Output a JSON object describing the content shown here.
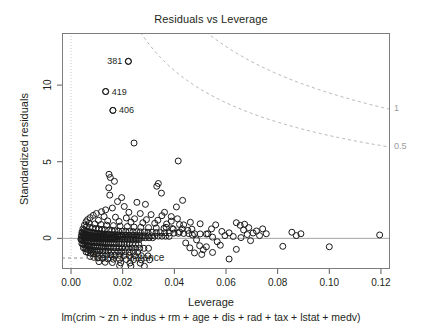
{
  "chart_data": {
    "type": "scatter",
    "title": "Residuals vs Leverage",
    "xlabel": "Leverage",
    "ylabel": "Standardized residuals",
    "caption": "lm(crim ~ zn + indus + rm + age + dis + rad + tax + lstat + medv)",
    "xlim": [
      -0.0035,
      0.1235
    ],
    "ylim": [
      -2.0,
      13.4
    ],
    "xticks": [
      0.0,
      0.02,
      0.04,
      0.06,
      0.08,
      0.1,
      0.12
    ],
    "xtick_labels": [
      "0.00",
      "0.02",
      "0.04",
      "0.06",
      "0.08",
      "0.10",
      "0.12"
    ],
    "yticks": [
      0,
      5,
      10
    ],
    "ytick_labels": [
      "0",
      "5",
      "10"
    ],
    "grid": false,
    "legend": {
      "position": "bottom-left",
      "label": "Cook's distance",
      "style": "dashed"
    },
    "reference_lines": {
      "horizontal_y": 0,
      "vertical_x": 0,
      "color": "#8c8c8c"
    },
    "cooks_contours": {
      "levels": [
        0.5,
        1
      ],
      "labels": [
        "0.5",
        "1"
      ],
      "p": 10,
      "color": "#b0b0b0",
      "style": "dashed"
    },
    "labeled_points": [
      {
        "label": "381",
        "x": 0.0222,
        "y": 11.55,
        "label_side": "left"
      },
      {
        "label": "419",
        "x": 0.0134,
        "y": 9.58,
        "label_side": "right"
      },
      {
        "label": "406",
        "x": 0.0162,
        "y": 8.35,
        "label_side": "right"
      }
    ],
    "point_style": {
      "marker": "open-circle",
      "radius": 3.0,
      "color": "#1a1a1a"
    },
    "points": [
      [
        0.0222,
        11.55
      ],
      [
        0.0134,
        9.58
      ],
      [
        0.0162,
        8.35
      ],
      [
        0.0244,
        6.22
      ],
      [
        0.0415,
        5.05
      ],
      [
        0.0147,
        4.18
      ],
      [
        0.0152,
        3.97
      ],
      [
        0.0168,
        3.72
      ],
      [
        0.0146,
        3.3
      ],
      [
        0.0338,
        3.58
      ],
      [
        0.0332,
        3.4
      ],
      [
        0.015,
        2.82
      ],
      [
        0.0196,
        2.66
      ],
      [
        0.018,
        2.4
      ],
      [
        0.0255,
        2.35
      ],
      [
        0.0288,
        2.22
      ],
      [
        0.0206,
        2.08
      ],
      [
        0.016,
        1.98
      ],
      [
        0.0134,
        1.86
      ],
      [
        0.0118,
        1.74
      ],
      [
        0.0224,
        1.7
      ],
      [
        0.0268,
        1.62
      ],
      [
        0.031,
        1.55
      ],
      [
        0.0352,
        1.48
      ],
      [
        0.0098,
        1.62
      ],
      [
        0.0086,
        1.5
      ],
      [
        0.0128,
        1.42
      ],
      [
        0.0172,
        1.38
      ],
      [
        0.0214,
        1.33
      ],
      [
        0.0246,
        1.28
      ],
      [
        0.0292,
        1.22
      ],
      [
        0.0336,
        1.18
      ],
      [
        0.0388,
        1.12
      ],
      [
        0.0074,
        1.35
      ],
      [
        0.0064,
        1.22
      ],
      [
        0.0106,
        1.18
      ],
      [
        0.0142,
        1.14
      ],
      [
        0.0186,
        1.1
      ],
      [
        0.0232,
        1.06
      ],
      [
        0.0278,
        1.02
      ],
      [
        0.0324,
        0.98
      ],
      [
        0.037,
        0.94
      ],
      [
        0.042,
        0.9
      ],
      [
        0.0058,
        1.08
      ],
      [
        0.007,
        0.98
      ],
      [
        0.0092,
        0.94
      ],
      [
        0.0116,
        0.9
      ],
      [
        0.0138,
        0.86
      ],
      [
        0.0164,
        0.83
      ],
      [
        0.019,
        0.8
      ],
      [
        0.0218,
        0.77
      ],
      [
        0.0244,
        0.74
      ],
      [
        0.027,
        0.72
      ],
      [
        0.03,
        0.7
      ],
      [
        0.033,
        0.68
      ],
      [
        0.036,
        0.66
      ],
      [
        0.0392,
        0.64
      ],
      [
        0.043,
        0.62
      ],
      [
        0.0468,
        0.6
      ],
      [
        0.0052,
        0.86
      ],
      [
        0.006,
        0.78
      ],
      [
        0.0072,
        0.72
      ],
      [
        0.0084,
        0.68
      ],
      [
        0.0096,
        0.64
      ],
      [
        0.0108,
        0.61
      ],
      [
        0.012,
        0.58
      ],
      [
        0.0132,
        0.56
      ],
      [
        0.0146,
        0.54
      ],
      [
        0.0158,
        0.52
      ],
      [
        0.017,
        0.5
      ],
      [
        0.0184,
        0.48
      ],
      [
        0.0198,
        0.47
      ],
      [
        0.0212,
        0.46
      ],
      [
        0.0226,
        0.45
      ],
      [
        0.024,
        0.44
      ],
      [
        0.0254,
        0.43
      ],
      [
        0.0268,
        0.42
      ],
      [
        0.0284,
        0.41
      ],
      [
        0.0298,
        0.4
      ],
      [
        0.0314,
        0.39
      ],
      [
        0.033,
        0.38
      ],
      [
        0.0346,
        0.37
      ],
      [
        0.0362,
        0.36
      ],
      [
        0.038,
        0.35
      ],
      [
        0.0398,
        0.34
      ],
      [
        0.0416,
        0.33
      ],
      [
        0.0436,
        0.32
      ],
      [
        0.0456,
        0.31
      ],
      [
        0.0478,
        0.3
      ],
      [
        0.05,
        0.29
      ],
      [
        0.0524,
        0.28
      ],
      [
        0.0046,
        0.62
      ],
      [
        0.005,
        0.55
      ],
      [
        0.0056,
        0.5
      ],
      [
        0.0062,
        0.46
      ],
      [
        0.0068,
        0.43
      ],
      [
        0.0074,
        0.4
      ],
      [
        0.008,
        0.38
      ],
      [
        0.0086,
        0.36
      ],
      [
        0.0092,
        0.34
      ],
      [
        0.0098,
        0.32
      ],
      [
        0.0104,
        0.31
      ],
      [
        0.011,
        0.3
      ],
      [
        0.0116,
        0.29
      ],
      [
        0.0122,
        0.28
      ],
      [
        0.0128,
        0.27
      ],
      [
        0.0134,
        0.26
      ],
      [
        0.014,
        0.25
      ],
      [
        0.0148,
        0.25
      ],
      [
        0.0156,
        0.24
      ],
      [
        0.0164,
        0.23
      ],
      [
        0.0172,
        0.23
      ],
      [
        0.018,
        0.22
      ],
      [
        0.0188,
        0.22
      ],
      [
        0.0196,
        0.21
      ],
      [
        0.0204,
        0.21
      ],
      [
        0.0214,
        0.2
      ],
      [
        0.0224,
        0.2
      ],
      [
        0.0234,
        0.19
      ],
      [
        0.0244,
        0.19
      ],
      [
        0.0254,
        0.18
      ],
      [
        0.0264,
        0.18
      ],
      [
        0.0276,
        0.17
      ],
      [
        0.0288,
        0.17
      ],
      [
        0.03,
        0.16
      ],
      [
        0.0312,
        0.16
      ],
      [
        0.0324,
        0.15
      ],
      [
        0.0338,
        0.15
      ],
      [
        0.0352,
        0.14
      ],
      [
        0.0366,
        0.14
      ],
      [
        0.038,
        0.13
      ],
      [
        0.0042,
        0.4
      ],
      [
        0.0044,
        0.34
      ],
      [
        0.0048,
        0.3
      ],
      [
        0.0052,
        0.27
      ],
      [
        0.0058,
        0.24
      ],
      [
        0.0064,
        0.22
      ],
      [
        0.007,
        0.2
      ],
      [
        0.0076,
        0.18
      ],
      [
        0.0082,
        0.17
      ],
      [
        0.0088,
        0.16
      ],
      [
        0.0094,
        0.15
      ],
      [
        0.01,
        0.14
      ],
      [
        0.0106,
        0.13
      ],
      [
        0.0112,
        0.12
      ],
      [
        0.0118,
        0.12
      ],
      [
        0.0124,
        0.11
      ],
      [
        0.013,
        0.11
      ],
      [
        0.0136,
        0.1
      ],
      [
        0.0142,
        0.1
      ],
      [
        0.015,
        0.09
      ],
      [
        0.0158,
        0.09
      ],
      [
        0.0166,
        0.08
      ],
      [
        0.0174,
        0.08
      ],
      [
        0.0182,
        0.08
      ],
      [
        0.019,
        0.07
      ],
      [
        0.02,
        0.07
      ],
      [
        0.021,
        0.07
      ],
      [
        0.022,
        0.06
      ],
      [
        0.023,
        0.06
      ],
      [
        0.024,
        0.06
      ],
      [
        0.0252,
        0.05
      ],
      [
        0.0264,
        0.05
      ],
      [
        0.0276,
        0.05
      ],
      [
        0.0288,
        0.04
      ],
      [
        0.0302,
        0.04
      ],
      [
        0.0316,
        0.04
      ],
      [
        0.004,
        0.18
      ],
      [
        0.0042,
        0.14
      ],
      [
        0.0046,
        0.11
      ],
      [
        0.005,
        0.09
      ],
      [
        0.0054,
        0.07
      ],
      [
        0.0058,
        0.05
      ],
      [
        0.0064,
        0.04
      ],
      [
        0.007,
        0.03
      ],
      [
        0.0076,
        0.02
      ],
      [
        0.0082,
        0.01
      ],
      [
        0.0088,
        0.0
      ],
      [
        0.0094,
        0.0
      ],
      [
        0.01,
        -0.01
      ],
      [
        0.0106,
        -0.01
      ],
      [
        0.0112,
        -0.02
      ],
      [
        0.0118,
        -0.02
      ],
      [
        0.0124,
        -0.03
      ],
      [
        0.013,
        -0.03
      ],
      [
        0.0138,
        -0.03
      ],
      [
        0.0146,
        -0.04
      ],
      [
        0.0154,
        -0.04
      ],
      [
        0.0162,
        -0.04
      ],
      [
        0.017,
        -0.05
      ],
      [
        0.0178,
        -0.05
      ],
      [
        0.0188,
        -0.05
      ],
      [
        0.0198,
        -0.06
      ],
      [
        0.0208,
        -0.06
      ],
      [
        0.0218,
        -0.06
      ],
      [
        0.0228,
        -0.07
      ],
      [
        0.024,
        -0.07
      ],
      [
        0.0252,
        -0.07
      ],
      [
        0.0264,
        -0.08
      ],
      [
        0.0038,
        -0.05
      ],
      [
        0.004,
        -0.09
      ],
      [
        0.0044,
        -0.12
      ],
      [
        0.0048,
        -0.15
      ],
      [
        0.0052,
        -0.17
      ],
      [
        0.0056,
        -0.19
      ],
      [
        0.0062,
        -0.21
      ],
      [
        0.0068,
        -0.23
      ],
      [
        0.0074,
        -0.24
      ],
      [
        0.008,
        -0.25
      ],
      [
        0.0086,
        -0.26
      ],
      [
        0.0092,
        -0.27
      ],
      [
        0.0098,
        -0.28
      ],
      [
        0.0104,
        -0.29
      ],
      [
        0.011,
        -0.3
      ],
      [
        0.0116,
        -0.3
      ],
      [
        0.0122,
        -0.31
      ],
      [
        0.0128,
        -0.32
      ],
      [
        0.0136,
        -0.32
      ],
      [
        0.0144,
        -0.33
      ],
      [
        0.0152,
        -0.33
      ],
      [
        0.016,
        -0.34
      ],
      [
        0.0168,
        -0.34
      ],
      [
        0.0176,
        -0.35
      ],
      [
        0.0186,
        -0.35
      ],
      [
        0.0196,
        -0.36
      ],
      [
        0.0206,
        -0.36
      ],
      [
        0.0216,
        -0.37
      ],
      [
        0.0226,
        -0.37
      ],
      [
        0.0238,
        -0.38
      ],
      [
        0.025,
        -0.38
      ],
      [
        0.0262,
        -0.39
      ],
      [
        0.0042,
        -0.34
      ],
      [
        0.0046,
        -0.38
      ],
      [
        0.005,
        -0.42
      ],
      [
        0.0056,
        -0.45
      ],
      [
        0.0062,
        -0.47
      ],
      [
        0.0068,
        -0.49
      ],
      [
        0.0074,
        -0.51
      ],
      [
        0.008,
        -0.52
      ],
      [
        0.0086,
        -0.53
      ],
      [
        0.0094,
        -0.54
      ],
      [
        0.0102,
        -0.55
      ],
      [
        0.011,
        -0.56
      ],
      [
        0.0118,
        -0.57
      ],
      [
        0.0126,
        -0.58
      ],
      [
        0.0134,
        -0.58
      ],
      [
        0.0144,
        -0.59
      ],
      [
        0.0154,
        -0.6
      ],
      [
        0.0164,
        -0.6
      ],
      [
        0.0174,
        -0.61
      ],
      [
        0.0186,
        -0.61
      ],
      [
        0.0198,
        -0.62
      ],
      [
        0.021,
        -0.62
      ],
      [
        0.0222,
        -0.63
      ],
      [
        0.0236,
        -0.63
      ],
      [
        0.025,
        -0.64
      ],
      [
        0.0266,
        -0.64
      ],
      [
        0.0282,
        -0.65
      ],
      [
        0.03,
        -0.65
      ],
      [
        0.0048,
        -0.62
      ],
      [
        0.0054,
        -0.66
      ],
      [
        0.006,
        -0.7
      ],
      [
        0.0068,
        -0.73
      ],
      [
        0.0076,
        -0.75
      ],
      [
        0.0084,
        -0.77
      ],
      [
        0.0092,
        -0.79
      ],
      [
        0.0102,
        -0.8
      ],
      [
        0.0112,
        -0.81
      ],
      [
        0.0122,
        -0.82
      ],
      [
        0.0132,
        -0.83
      ],
      [
        0.0144,
        -0.84
      ],
      [
        0.0156,
        -0.85
      ],
      [
        0.0168,
        -0.85
      ],
      [
        0.0182,
        -0.86
      ],
      [
        0.0196,
        -0.87
      ],
      [
        0.021,
        -0.87
      ],
      [
        0.0226,
        -0.88
      ],
      [
        0.0242,
        -0.88
      ],
      [
        0.0258,
        -0.89
      ],
      [
        0.0058,
        -0.88
      ],
      [
        0.0066,
        -0.93
      ],
      [
        0.0076,
        -0.97
      ],
      [
        0.0086,
        -1.0
      ],
      [
        0.0098,
        -1.03
      ],
      [
        0.011,
        -1.05
      ],
      [
        0.0124,
        -1.07
      ],
      [
        0.0138,
        -1.08
      ],
      [
        0.0154,
        -1.09
      ],
      [
        0.017,
        -1.1
      ],
      [
        0.0188,
        -1.11
      ],
      [
        0.0206,
        -1.12
      ],
      [
        0.0226,
        -1.12
      ],
      [
        0.0248,
        -1.13
      ],
      [
        0.0272,
        -1.13
      ],
      [
        0.0298,
        -1.14
      ],
      [
        0.0074,
        -1.18
      ],
      [
        0.0088,
        -1.24
      ],
      [
        0.0104,
        -1.28
      ],
      [
        0.0122,
        -1.31
      ],
      [
        0.0142,
        -1.34
      ],
      [
        0.0164,
        -1.36
      ],
      [
        0.0188,
        -1.37
      ],
      [
        0.0214,
        -1.38
      ],
      [
        0.0242,
        -1.39
      ],
      [
        0.0272,
        -1.4
      ],
      [
        0.0304,
        -1.4
      ],
      [
        0.0108,
        -1.52
      ],
      [
        0.0132,
        -1.56
      ],
      [
        0.016,
        -1.58
      ],
      [
        0.0192,
        -1.6
      ],
      [
        0.0228,
        -1.61
      ],
      [
        0.0268,
        -1.62
      ],
      [
        0.0188,
        -1.78
      ],
      [
        0.0232,
        -1.8
      ],
      [
        0.0284,
        -1.82
      ],
      [
        0.0362,
        1.7
      ],
      [
        0.0388,
        1.42
      ],
      [
        0.0412,
        1.28
      ],
      [
        0.0436,
        0.88
      ],
      [
        0.0452,
        0.52
      ],
      [
        0.047,
        0.22
      ],
      [
        0.0486,
        -0.1
      ],
      [
        0.0498,
        -0.48
      ],
      [
        0.0512,
        -0.74
      ],
      [
        0.053,
        0.3
      ],
      [
        0.0548,
        0.08
      ],
      [
        0.0566,
        -0.22
      ],
      [
        0.0584,
        0.45
      ],
      [
        0.0408,
        2.05
      ],
      [
        0.0432,
        2.48
      ],
      [
        0.035,
        2.95
      ],
      [
        0.0368,
        0.72
      ],
      [
        0.0396,
        0.6
      ],
      [
        0.042,
        0.42
      ],
      [
        0.0444,
        -0.3
      ],
      [
        0.046,
        -0.62
      ],
      [
        0.0478,
        -0.95
      ],
      [
        0.0506,
        -1.05
      ],
      [
        0.0524,
        -0.55
      ],
      [
        0.0544,
        0.62
      ],
      [
        0.056,
        0.88
      ],
      [
        0.0578,
        -0.45
      ],
      [
        0.0596,
        0.18
      ],
      [
        0.0612,
        0.36
      ],
      [
        0.0628,
        0.12
      ],
      [
        0.064,
        -0.72
      ],
      [
        0.0658,
        0.05
      ],
      [
        0.0668,
        0.55
      ],
      [
        0.0682,
        0.25
      ],
      [
        0.0695,
        -0.15
      ],
      [
        0.0705,
        0.35
      ],
      [
        0.0718,
        0.48
      ],
      [
        0.073,
        0.18
      ],
      [
        0.0742,
        0.62
      ],
      [
        0.0756,
        0.3
      ],
      [
        0.064,
        1.02
      ],
      [
        0.0655,
        0.85
      ],
      [
        0.0672,
        0.92
      ],
      [
        0.0688,
        0.7
      ],
      [
        0.0612,
        -1.35
      ],
      [
        0.0548,
        -0.92
      ],
      [
        0.05,
        0.95
      ],
      [
        0.0462,
        1.05
      ],
      [
        0.082,
        -0.52
      ],
      [
        0.0855,
        0.4
      ],
      [
        0.0872,
        0.18
      ],
      [
        0.089,
        0.3
      ],
      [
        0.1,
        -0.55
      ],
      [
        0.1195,
        0.22
      ]
    ]
  }
}
